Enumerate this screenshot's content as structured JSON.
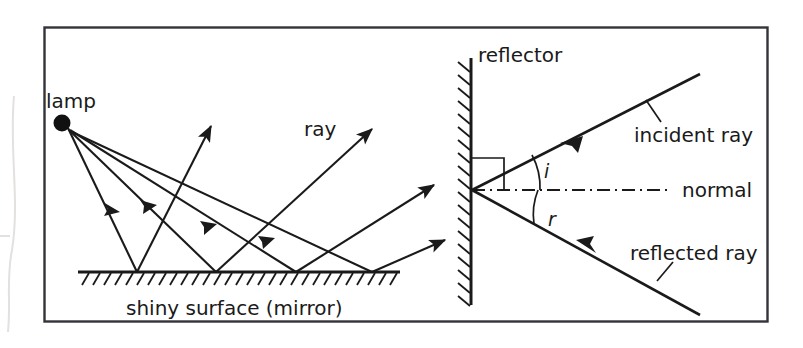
{
  "figure": {
    "border_color": "#33333a",
    "ink_color": "#1a1a1a",
    "panels": [
      {
        "id": "left-panel",
        "name": "lamp-and-shiny-surface",
        "labels": {
          "lamp": "lamp",
          "ray": "ray",
          "surface": "shiny surface (mirror)"
        }
      },
      {
        "id": "right-panel",
        "name": "reflector-angles",
        "labels": {
          "reflector": "reflector",
          "incident_ray": "incident ray",
          "reflected_ray": "reflected ray",
          "normal": "normal",
          "angle_incidence": "i",
          "angle_reflection": "r"
        }
      }
    ]
  },
  "geometry": {
    "frame": {
      "x": 44,
      "y": 27,
      "width": 724,
      "height": 295
    },
    "lamp": {
      "cx": 62,
      "cy": 123,
      "r": 8
    },
    "mirror_line": {
      "x1": 78,
      "y1": 272,
      "x2": 400,
      "y2": 272
    },
    "mirror_hatch": {
      "count": 29,
      "spacing": 11,
      "length": 13,
      "dx": -7,
      "dy": 12
    },
    "reflector_line": {
      "x": 471,
      "y1": 58,
      "y2": 305
    },
    "reflector_hatch": {
      "count": 19,
      "spacing": 13,
      "length": 15,
      "dx": -12,
      "dy": -9
    },
    "normal_line": {
      "x1": 472,
      "y1": 190,
      "x2": 672,
      "y2": 190
    },
    "vertex": {
      "x": 472,
      "y": 190
    },
    "incident_ray": {
      "x1": 700,
      "y1": 74,
      "x2": 472,
      "y2": 190,
      "arrow_t": 0.55
    },
    "reflected_ray": {
      "x1": 472,
      "y1": 190,
      "x2": 700,
      "y2": 315,
      "arrow_t": 0.52
    },
    "right_angle_box": {
      "x": 472,
      "y": 158,
      "size": 32
    },
    "incident_arc": {
      "r": 68,
      "label_x": 544,
      "label_y": 178
    },
    "reflected_arc": {
      "r": 66,
      "label_x": 548,
      "label_y": 226
    },
    "incident_leader": {
      "x1": 646,
      "y1": 100,
      "x2": 661,
      "y2": 122
    },
    "reflected_leader": {
      "x1": 657,
      "y1": 279,
      "x2": 672,
      "y2": 261
    },
    "incident_text": {
      "x": 634,
      "y": 142
    },
    "reflected_text": {
      "x": 630,
      "y": 260
    },
    "normal_text": {
      "x": 682,
      "y": 197
    },
    "reflector_text": {
      "x": 478,
      "y": 62
    },
    "lamp_text": {
      "x": 46,
      "y": 108
    },
    "ray_text": {
      "x": 304,
      "y": 136
    },
    "surface_text": {
      "x": 126,
      "y": 315
    }
  },
  "rays": {
    "incoming": [
      {
        "name": "lamp-ray-1",
        "x1": 68,
        "y1": 128,
        "x2": 137,
        "y2": 272,
        "arrow_t": 0.52
      },
      {
        "name": "lamp-ray-2",
        "x1": 69,
        "y1": 130,
        "x2": 216,
        "y2": 272,
        "arrow_t": 0.55
      },
      {
        "name": "lamp-ray-3",
        "x1": 70,
        "y1": 130,
        "x2": 296,
        "y2": 272,
        "arrow_t": 0.58
      },
      {
        "name": "lamp-ray-4",
        "x1": 70,
        "y1": 131,
        "x2": 372,
        "y2": 272,
        "arrow_t": 0.6
      }
    ],
    "outgoing": [
      {
        "name": "reflected-ray-1",
        "x1": 137,
        "y1": 272,
        "x2": 213,
        "y2": 122,
        "arrow_head": true
      },
      {
        "name": "reflected-ray-2",
        "x1": 216,
        "y1": 272,
        "x2": 375,
        "y2": 125,
        "arrow_head": true
      },
      {
        "name": "reflected-ray-3",
        "x1": 296,
        "y1": 272,
        "x2": 437,
        "y2": 182,
        "arrow_head": true
      },
      {
        "name": "reflected-ray-4",
        "x1": 372,
        "y1": 272,
        "x2": 448,
        "y2": 238,
        "arrow_head": true
      }
    ]
  },
  "artifact": {
    "name": "scan-edge-artifact",
    "color": "#e8e6e4"
  }
}
